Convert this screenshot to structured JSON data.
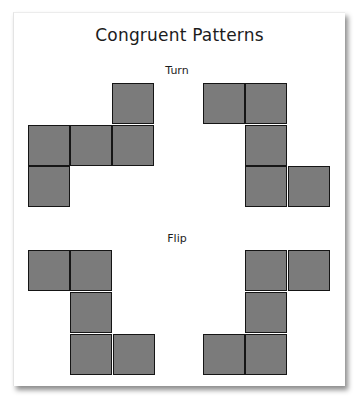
{
  "title": "Congruent Patterns",
  "sections": [
    {
      "label": "Turn",
      "label_top": 64,
      "shapes": [
        {
          "name": "turn-shape-left",
          "cells": [
            [
              112,
              83
            ],
            [
              28,
              125
            ],
            [
              70,
              125
            ],
            [
              112,
              125
            ],
            [
              28,
              166
            ]
          ]
        },
        {
          "name": "turn-shape-right",
          "cells": [
            [
              203,
              83
            ],
            [
              245,
              83
            ],
            [
              245,
              125
            ],
            [
              245,
              166
            ],
            [
              288,
              166
            ]
          ]
        }
      ]
    },
    {
      "label": "Flip",
      "label_top": 232,
      "shapes": [
        {
          "name": "flip-shape-left",
          "cells": [
            [
              28,
              250
            ],
            [
              70,
              250
            ],
            [
              70,
              292
            ],
            [
              70,
              334
            ],
            [
              113,
              334
            ]
          ]
        },
        {
          "name": "flip-shape-right",
          "cells": [
            [
              245,
              250
            ],
            [
              288,
              250
            ],
            [
              245,
              292
            ],
            [
              203,
              334
            ],
            [
              245,
              334
            ]
          ]
        }
      ]
    }
  ],
  "colors": {
    "square_fill": "#7b7b7b",
    "square_border": "#151515",
    "card_background": "#ffffff"
  }
}
